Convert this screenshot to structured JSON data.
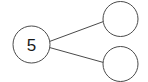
{
  "diagram": {
    "type": "number-bond",
    "background_color": "#ffffff",
    "stroke_color": "#4a4a4a",
    "text_color": "#1a1a1a",
    "stroke_width": 1,
    "nodes": [
      {
        "id": "whole",
        "role": "whole",
        "label": "5",
        "empty": false,
        "cx": 31.5,
        "cy": 44.5,
        "r": 18.5
      },
      {
        "id": "part-top",
        "role": "part",
        "label": "",
        "empty": true,
        "cx": 120.5,
        "cy": 19,
        "r": 17.5
      },
      {
        "id": "part-bottom",
        "role": "part",
        "label": "",
        "empty": true,
        "cx": 120.5,
        "cy": 64,
        "r": 17.5
      }
    ],
    "links": [
      {
        "id": "link-whole-to-part-top",
        "from": "whole",
        "to": "part-top",
        "x1": 49.5,
        "y1": 41.5,
        "x2": 103.5,
        "y2": 21.5
      },
      {
        "id": "link-whole-to-part-bottom",
        "from": "whole",
        "to": "part-bottom",
        "x1": 49.5,
        "y1": 47.5,
        "x2": 103.5,
        "y2": 62.5
      }
    ],
    "font_size_label": 17
  }
}
